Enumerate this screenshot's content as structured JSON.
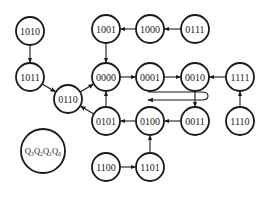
{
  "diagram": {
    "type": "state-transition-diagram",
    "legend": {
      "label": "Q₃Q₂Q₁Q₀",
      "x": 43,
      "y": 151,
      "r": 22
    },
    "nodes": [
      {
        "id": "1010",
        "label": "1010",
        "x": 30,
        "y": 31
      },
      {
        "id": "1001",
        "label": "1001",
        "x": 106,
        "y": 29
      },
      {
        "id": "1000",
        "label": "1000",
        "x": 150,
        "y": 29
      },
      {
        "id": "0111",
        "label": "0111",
        "x": 195,
        "y": 29
      },
      {
        "id": "1011",
        "label": "1011",
        "x": 30,
        "y": 77
      },
      {
        "id": "0000",
        "label": "0000",
        "x": 106,
        "y": 77
      },
      {
        "id": "0001",
        "label": "0001",
        "x": 150,
        "y": 77
      },
      {
        "id": "0010",
        "label": "0010",
        "x": 195,
        "y": 77
      },
      {
        "id": "1111",
        "label": "1111",
        "x": 240,
        "y": 77
      },
      {
        "id": "0110",
        "label": "0110",
        "x": 68,
        "y": 99
      },
      {
        "id": "0101",
        "label": "0101",
        "x": 106,
        "y": 121
      },
      {
        "id": "0100",
        "label": "0100",
        "x": 150,
        "y": 121
      },
      {
        "id": "0011",
        "label": "0011",
        "x": 195,
        "y": 121
      },
      {
        "id": "1110",
        "label": "1110",
        "x": 240,
        "y": 121
      },
      {
        "id": "1100",
        "label": "1100",
        "x": 106,
        "y": 167
      },
      {
        "id": "1101",
        "label": "1101",
        "x": 150,
        "y": 167
      }
    ],
    "edges": [
      {
        "from": "1010",
        "to": "1011"
      },
      {
        "from": "0111",
        "to": "1000"
      },
      {
        "from": "1000",
        "to": "1001"
      },
      {
        "from": "1001",
        "to": "0000"
      },
      {
        "from": "1011",
        "to": "0110"
      },
      {
        "from": "0110",
        "to": "0000"
      },
      {
        "from": "0000",
        "to": "0001"
      },
      {
        "from": "0001",
        "to": "0010"
      },
      {
        "from": "1111",
        "to": "0010"
      },
      {
        "from": "1110",
        "to": "1111"
      },
      {
        "from": "0010",
        "to": "0011"
      },
      {
        "from": "0011",
        "to": "0100"
      },
      {
        "from": "0100",
        "to": "0101"
      },
      {
        "from": "0101",
        "to": "0000"
      },
      {
        "from": "0101",
        "to": "0110"
      },
      {
        "from": "1101",
        "to": "0100"
      },
      {
        "from": "1100",
        "to": "1101"
      }
    ],
    "cycle_arrow": {
      "direction": "counter-clockwise",
      "description": "cyclic counting direction indicator"
    },
    "colors": {
      "stroke": "#1a1a1a",
      "background": "#ffffff"
    }
  }
}
